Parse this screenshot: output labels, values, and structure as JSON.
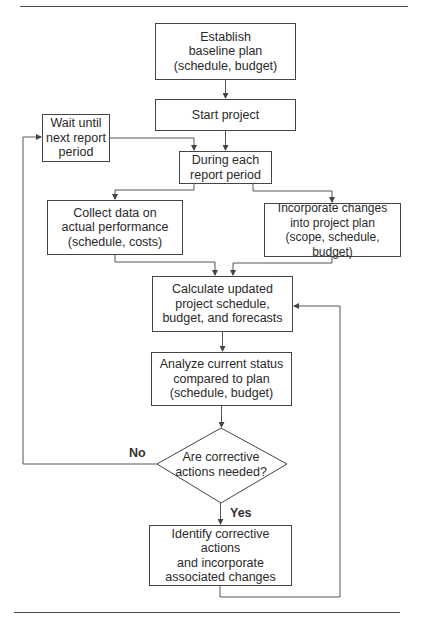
{
  "diagram": {
    "type": "flowchart",
    "nodes": {
      "establish": "Establish\nbaseline plan\n(schedule, budget)",
      "start": "Start project",
      "wait": "Wait until\nnext report\nperiod",
      "during": "During each\nreport period",
      "collect": "Collect data on\nactual performance\n(schedule, costs)",
      "incorporate": "Incorporate changes\ninto project plan\n(scope, schedule, budget)",
      "calculate": "Calculate updated\nproject schedule,\nbudget, and forecasts",
      "analyze": "Analyze current status\ncompared to plan\n(schedule, budget)",
      "decision": "Are corrective\nactions needed?",
      "identify": "Identify corrective actions\nand incorporate\nassociated changes"
    },
    "edge_labels": {
      "no": "No",
      "yes": "Yes"
    },
    "edges": [
      [
        "establish",
        "start"
      ],
      [
        "start",
        "during"
      ],
      [
        "wait",
        "during"
      ],
      [
        "during",
        "collect"
      ],
      [
        "during",
        "incorporate"
      ],
      [
        "collect",
        "calculate"
      ],
      [
        "incorporate",
        "calculate"
      ],
      [
        "calculate",
        "analyze"
      ],
      [
        "analyze",
        "decision"
      ],
      [
        "decision",
        "wait",
        "No"
      ],
      [
        "decision",
        "identify",
        "Yes"
      ],
      [
        "identify",
        "calculate"
      ]
    ]
  }
}
